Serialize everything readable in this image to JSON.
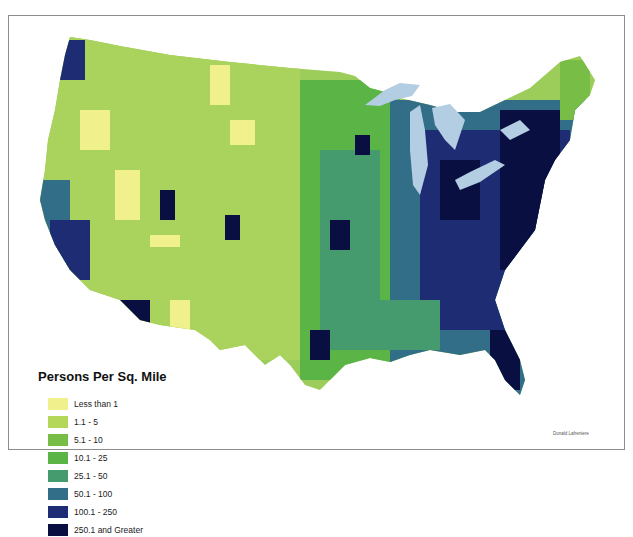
{
  "map": {
    "title": "Persons Per Sq. Mile",
    "subject": "US county population density",
    "credit": "Donald Lafreniere",
    "water_color": "#b3cde3",
    "legend": {
      "title": "Persons Per Sq. Mile",
      "items": [
        {
          "label": "Less than 1",
          "color": "#f0f08c"
        },
        {
          "label": "1.1 - 5",
          "color": "#b4d75a"
        },
        {
          "label": "5.1 - 10",
          "color": "#78be46"
        },
        {
          "label": "10.1 - 25",
          "color": "#5ab446"
        },
        {
          "label": "25.1 - 50",
          "color": "#469b6e"
        },
        {
          "label": "50.1 - 100",
          "color": "#326e87"
        },
        {
          "label": "100.1 - 250",
          "color": "#1e2d73"
        },
        {
          "label": "250.1 and Greater",
          "color": "#0a0f41"
        }
      ]
    }
  }
}
